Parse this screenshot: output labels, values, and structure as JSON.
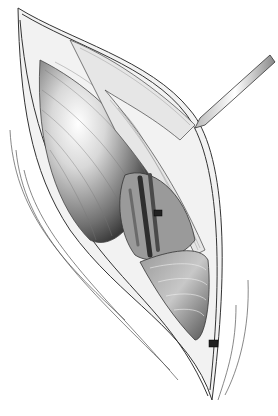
{
  "image": {
    "type": "illustration",
    "style": "grayscale pen-and-ink medical illustration",
    "subject": "surgical incision with retracted muscle layers exposing underlying structures",
    "elements": [
      "incision-edges",
      "skin-folds",
      "muscle-fibers",
      "retracted-fascia",
      "exposed-vessels",
      "surgical-instrument",
      "suture-clip-upper",
      "suture-clip-lower"
    ],
    "colors": {
      "background": "#ffffff",
      "ink": "#2a2a2a",
      "mid": "#8a8a8a",
      "highlight": "#f4f4f4"
    }
  }
}
